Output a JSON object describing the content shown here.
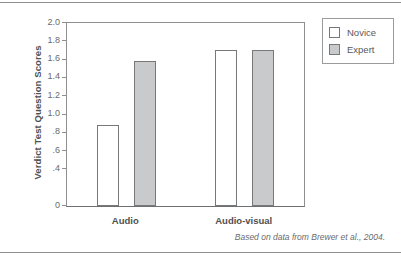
{
  "figure": {
    "y_axis_title": "Verdict Test Question Scores",
    "source_note": "Based on data from Brewer et al., 2004.",
    "legend": {
      "novice_label": "Novice",
      "expert_label": "Expert"
    }
  },
  "chart_data": {
    "type": "bar",
    "title": "",
    "xlabel": "",
    "ylabel": "Verdict Test Question Scores",
    "categories": [
      "Audio",
      "Audio-visual"
    ],
    "series": [
      {
        "name": "Novice",
        "values": [
          0.88,
          1.71
        ],
        "color": "#ffffff"
      },
      {
        "name": "Expert",
        "values": [
          1.59,
          1.71
        ],
        "color": "#c9cacb"
      }
    ],
    "ylim": [
      0,
      2.0
    ],
    "ytick_values": [
      2.0,
      1.8,
      1.6,
      1.4,
      1.2,
      1.0,
      0.8,
      0.6,
      0.4,
      0.0
    ],
    "ytick_labels": [
      "2.0",
      "1.8",
      "1.6",
      "1.4",
      "1.2",
      "1.0",
      ".8",
      ".6",
      ".4",
      "0"
    ],
    "grid": false,
    "legend_position": "right-top",
    "annotations": [
      "Based on data from Brewer et al., 2004."
    ]
  }
}
